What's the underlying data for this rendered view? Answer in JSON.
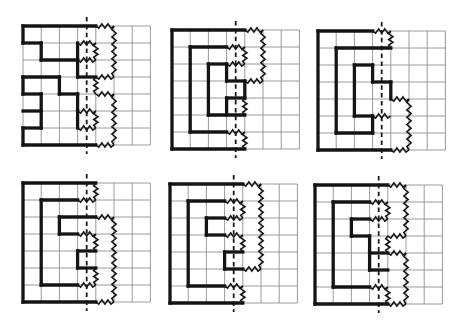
{
  "figure": {
    "background_color": "#ffffff",
    "grid_color": "#8f8f8f",
    "shape_color": "#141414",
    "fold_line_color": "#1a1a1a",
    "grid_cols": 7,
    "grid_rows": 7,
    "cell_w": 18.2,
    "cell_h": 17.0,
    "fold_line_x_cells": 3.5,
    "fold_overhang_px": 9,
    "grid_stroke_px": 0.9,
    "shape_stroke_px": 3.3,
    "zigzag_stroke_px": 1.5,
    "zigzag_amplitude_px": 2.2,
    "zigzag_step_px": 3.6,
    "fold_stroke_px": 1.8,
    "fold_dash_pattern": "4.5 3.4",
    "panels": [
      {
        "id": "panel-1",
        "grid_x": 23,
        "grid_y": 26,
        "solid": [
          [
            0,
            0,
            4,
            0
          ],
          [
            0,
            0,
            0,
            1
          ],
          [
            0,
            1,
            1,
            1
          ],
          [
            1,
            1,
            1,
            2
          ],
          [
            1,
            2,
            3,
            2
          ],
          [
            3,
            1,
            3,
            2
          ],
          [
            3,
            2,
            3,
            3
          ],
          [
            3,
            3,
            4,
            3
          ],
          [
            0,
            3,
            2,
            3
          ],
          [
            2,
            3,
            2,
            4
          ],
          [
            2,
            4,
            3,
            4
          ],
          [
            3,
            4,
            3,
            5
          ],
          [
            3,
            5,
            3,
            6
          ],
          [
            0,
            3,
            0,
            4
          ],
          [
            0,
            4,
            1,
            4
          ],
          [
            1,
            4,
            1,
            6
          ],
          [
            0,
            5,
            1,
            5
          ],
          [
            0,
            6,
            1,
            6
          ],
          [
            0,
            6,
            0,
            7
          ],
          [
            0,
            7,
            4,
            7
          ]
        ],
        "zigzag": [
          [
            4,
            0,
            5,
            0
          ],
          [
            5,
            0,
            5,
            3
          ],
          [
            4,
            3,
            5,
            3
          ],
          [
            4,
            3,
            4,
            4
          ],
          [
            4,
            4,
            5,
            4
          ],
          [
            5,
            4,
            5,
            7
          ],
          [
            4,
            7,
            5,
            7
          ],
          [
            3,
            1,
            4,
            1
          ],
          [
            4,
            1,
            4,
            2
          ],
          [
            3,
            2,
            4,
            2
          ],
          [
            3,
            5,
            4,
            5
          ],
          [
            4,
            5,
            4,
            6
          ],
          [
            3,
            6,
            4,
            6
          ]
        ]
      },
      {
        "id": "panel-2",
        "grid_x": 172,
        "grid_y": 30,
        "solid": [
          [
            0,
            0,
            4,
            0
          ],
          [
            0,
            0,
            0,
            7
          ],
          [
            0,
            7,
            4,
            7
          ],
          [
            1,
            1,
            3,
            1
          ],
          [
            1,
            1,
            1,
            6
          ],
          [
            1,
            6,
            3,
            6
          ],
          [
            2,
            2,
            3,
            2
          ],
          [
            2,
            2,
            2,
            5
          ],
          [
            2,
            5,
            4,
            5
          ],
          [
            3,
            2,
            3,
            3
          ],
          [
            3,
            3,
            4,
            3
          ],
          [
            4,
            3,
            4,
            4
          ],
          [
            3,
            4,
            4,
            4
          ],
          [
            3,
            4,
            3,
            5
          ]
        ],
        "zigzag": [
          [
            4,
            0,
            5,
            0
          ],
          [
            5,
            0,
            5,
            3
          ],
          [
            4,
            3,
            5,
            3
          ],
          [
            3,
            1,
            4,
            1
          ],
          [
            4,
            1,
            4,
            2
          ],
          [
            3,
            2,
            4,
            2
          ],
          [
            4,
            4,
            4,
            5
          ],
          [
            3,
            6,
            4,
            6
          ],
          [
            4,
            6,
            4,
            7
          ]
        ]
      },
      {
        "id": "panel-3",
        "grid_x": 318,
        "grid_y": 31,
        "solid": [
          [
            0,
            0,
            3,
            0
          ],
          [
            0,
            0,
            0,
            7
          ],
          [
            0,
            7,
            4,
            7
          ],
          [
            1,
            1,
            4,
            1
          ],
          [
            1,
            1,
            1,
            6
          ],
          [
            1,
            6,
            3,
            6
          ],
          [
            3,
            5,
            3,
            6
          ],
          [
            2,
            5,
            3,
            5
          ],
          [
            2,
            2,
            2,
            5
          ],
          [
            2,
            2,
            3,
            2
          ],
          [
            3,
            2,
            3,
            3
          ],
          [
            3,
            3,
            4,
            3
          ],
          [
            4,
            3,
            4,
            4
          ]
        ],
        "zigzag": [
          [
            3,
            0,
            4,
            0
          ],
          [
            4,
            0,
            4,
            1
          ],
          [
            3,
            5,
            4,
            5
          ],
          [
            4,
            4,
            5,
            4
          ],
          [
            5,
            4,
            5,
            7
          ],
          [
            4,
            7,
            5,
            7
          ]
        ]
      },
      {
        "id": "panel-4",
        "grid_x": 23,
        "grid_y": 183,
        "solid": [
          [
            0,
            0,
            4,
            0
          ],
          [
            0,
            0,
            0,
            7
          ],
          [
            0,
            7,
            4,
            7
          ],
          [
            1,
            1,
            3,
            1
          ],
          [
            1,
            1,
            1,
            6
          ],
          [
            1,
            6,
            3,
            6
          ],
          [
            2,
            2,
            4,
            2
          ],
          [
            2,
            2,
            2,
            3
          ],
          [
            2,
            3,
            3,
            3
          ],
          [
            3,
            4,
            4,
            4
          ],
          [
            3,
            4,
            3,
            5
          ],
          [
            3,
            5,
            4,
            5
          ]
        ],
        "zigzag": [
          [
            4,
            0,
            4,
            1
          ],
          [
            3,
            1,
            4,
            1
          ],
          [
            4,
            2,
            5,
            2
          ],
          [
            3,
            3,
            4,
            3
          ],
          [
            4,
            3,
            4,
            4
          ],
          [
            4,
            5,
            4,
            6
          ],
          [
            3,
            6,
            4,
            6
          ],
          [
            5,
            2,
            5,
            7
          ],
          [
            4,
            7,
            5,
            7
          ]
        ]
      },
      {
        "id": "panel-5",
        "grid_x": 170,
        "grid_y": 184,
        "solid": [
          [
            0,
            0,
            4,
            0
          ],
          [
            0,
            0,
            0,
            7
          ],
          [
            0,
            7,
            4,
            7
          ],
          [
            1,
            1,
            3,
            1
          ],
          [
            1,
            1,
            1,
            6
          ],
          [
            1,
            6,
            3,
            6
          ],
          [
            2,
            2,
            3,
            2
          ],
          [
            2,
            2,
            2,
            3
          ],
          [
            2,
            3,
            3,
            3
          ],
          [
            3,
            4,
            4,
            4
          ],
          [
            3,
            4,
            3,
            5
          ],
          [
            3,
            5,
            4,
            5
          ]
        ],
        "zigzag": [
          [
            4,
            0,
            5,
            0
          ],
          [
            5,
            0,
            5,
            5
          ],
          [
            4,
            5,
            5,
            5
          ],
          [
            3,
            1,
            4,
            1
          ],
          [
            4,
            1,
            4,
            2
          ],
          [
            3,
            2,
            4,
            2
          ],
          [
            3,
            3,
            4,
            3
          ],
          [
            4,
            3,
            4,
            4
          ],
          [
            3,
            6,
            4,
            6
          ],
          [
            4,
            6,
            4,
            7
          ]
        ]
      },
      {
        "id": "panel-6",
        "grid_x": 315,
        "grid_y": 185,
        "solid": [
          [
            0,
            0,
            4,
            0
          ],
          [
            0,
            0,
            0,
            7
          ],
          [
            0,
            7,
            4,
            7
          ],
          [
            1,
            1,
            3,
            1
          ],
          [
            1,
            1,
            1,
            6
          ],
          [
            1,
            6,
            3,
            6
          ],
          [
            2,
            2,
            3,
            2
          ],
          [
            2,
            2,
            2,
            3
          ],
          [
            2,
            3,
            3,
            3
          ],
          [
            3,
            3,
            3,
            4
          ],
          [
            3,
            4,
            4,
            4
          ],
          [
            3,
            4,
            3,
            5
          ],
          [
            3,
            5,
            4,
            5
          ]
        ],
        "zigzag": [
          [
            4,
            0,
            5,
            0
          ],
          [
            5,
            0,
            5,
            3
          ],
          [
            4,
            3,
            5,
            3
          ],
          [
            4,
            3,
            4,
            4
          ],
          [
            4,
            4,
            5,
            4
          ],
          [
            5,
            4,
            5,
            7
          ],
          [
            4,
            7,
            5,
            7
          ],
          [
            3,
            1,
            4,
            1
          ],
          [
            4,
            1,
            4,
            2
          ],
          [
            3,
            2,
            4,
            2
          ],
          [
            3,
            6,
            4,
            6
          ],
          [
            4,
            6,
            4,
            7
          ]
        ]
      }
    ]
  }
}
